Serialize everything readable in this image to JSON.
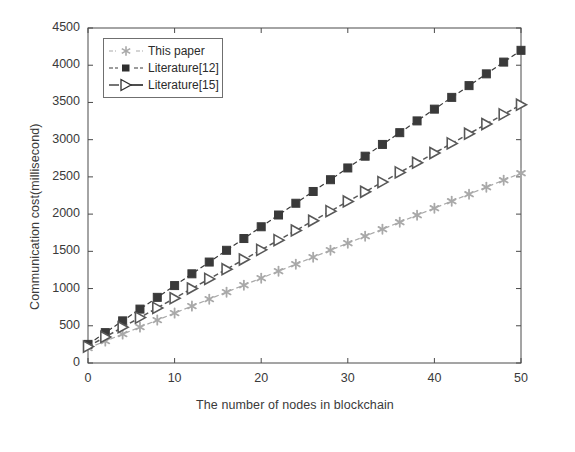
{
  "chart_data": {
    "type": "line",
    "title": "",
    "subtitle": "",
    "xlabel": "The number of nodes in blockchain",
    "ylabel": "Communication cost(millisecond)",
    "xlim": [
      0,
      50
    ],
    "ylim": [
      0,
      4500
    ],
    "xticks": [
      0,
      10,
      20,
      30,
      40,
      50
    ],
    "yticks": [
      0,
      500,
      1000,
      1500,
      2000,
      2500,
      3000,
      3500,
      4000,
      4500
    ],
    "xtick_labels": [
      "0",
      "10",
      "20",
      "30",
      "40",
      "50"
    ],
    "ytick_labels": [
      "0",
      "500",
      "1000",
      "1500",
      "2000",
      "2500",
      "3000",
      "3500",
      "4000",
      "4500"
    ],
    "grid": false,
    "legend_position": "upper left",
    "x": [
      0,
      2,
      4,
      6,
      8,
      10,
      12,
      14,
      16,
      18,
      20,
      22,
      24,
      26,
      28,
      30,
      32,
      34,
      36,
      38,
      40,
      42,
      44,
      46,
      48,
      50
    ],
    "series": [
      {
        "name": "This paper",
        "marker": "asterisk",
        "color": "#a9a9a9",
        "linestyle": "dashed",
        "values": [
          200,
          294,
          388,
          482,
          576,
          670,
          764,
          858,
          952,
          1046,
          1140,
          1234,
          1328,
          1422,
          1516,
          1610,
          1704,
          1798,
          1892,
          1986,
          2080,
          2174,
          2268,
          2362,
          2456,
          2550
        ]
      },
      {
        "name": "Literature[12]",
        "marker": "square",
        "color": "#3a3a3a",
        "linestyle": "dashed",
        "values": [
          250,
          408,
          566,
          724,
          882,
          1040,
          1198,
          1356,
          1514,
          1672,
          1830,
          1988,
          2146,
          2304,
          2462,
          2620,
          2778,
          2936,
          3094,
          3252,
          3410,
          3568,
          3726,
          3884,
          4042,
          4200
        ]
      },
      {
        "name": "Literature[15]",
        "marker": "right-triangle",
        "color": "#585858",
        "linestyle": "dashed",
        "values": [
          220,
          350,
          480,
          610,
          740,
          870,
          1000,
          1130,
          1260,
          1390,
          1520,
          1650,
          1780,
          1910,
          2040,
          2170,
          2300,
          2430,
          2560,
          2690,
          2820,
          2950,
          3080,
          3210,
          3340,
          3470
        ]
      }
    ]
  },
  "legend": {
    "items": [
      {
        "label": "This paper"
      },
      {
        "label": "Literature[12]"
      },
      {
        "label": "Literature[15]"
      }
    ]
  },
  "axes": {
    "x_axis_label": "The number of nodes in blockchain",
    "y_axis_label": "Communication cost(millisecond)"
  }
}
